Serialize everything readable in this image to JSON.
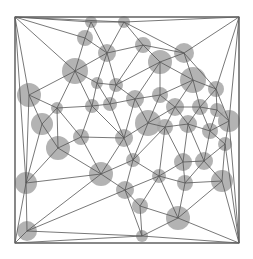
{
  "diagram": {
    "type": "triangulated-graph",
    "node_color": "#a6a6a6",
    "edge_color": "#555555",
    "border": {
      "x1": 15,
      "y1": 17,
      "x2": 239,
      "y2": 243
    },
    "nodes": [
      {
        "x": 15,
        "y": 17,
        "r": 0
      },
      {
        "x": 239,
        "y": 17,
        "r": 0
      },
      {
        "x": 15,
        "y": 243,
        "r": 0
      },
      {
        "x": 239,
        "y": 243,
        "r": 0
      },
      {
        "x": 91,
        "y": 22,
        "r": 6
      },
      {
        "x": 124,
        "y": 22,
        "r": 6
      },
      {
        "x": 85,
        "y": 38,
        "r": 8
      },
      {
        "x": 107,
        "y": 53,
        "r": 9
      },
      {
        "x": 143,
        "y": 45,
        "r": 8
      },
      {
        "x": 75,
        "y": 71,
        "r": 13
      },
      {
        "x": 160,
        "y": 62,
        "r": 12
      },
      {
        "x": 184,
        "y": 53,
        "r": 10
      },
      {
        "x": 97,
        "y": 83,
        "r": 6
      },
      {
        "x": 116,
        "y": 85,
        "r": 7
      },
      {
        "x": 29,
        "y": 95,
        "r": 12
      },
      {
        "x": 57,
        "y": 108,
        "r": 6
      },
      {
        "x": 135,
        "y": 99,
        "r": 9
      },
      {
        "x": 193,
        "y": 80,
        "r": 13
      },
      {
        "x": 216,
        "y": 89,
        "r": 8
      },
      {
        "x": 92,
        "y": 106,
        "r": 7
      },
      {
        "x": 110,
        "y": 104,
        "r": 7
      },
      {
        "x": 160,
        "y": 95,
        "r": 8
      },
      {
        "x": 42,
        "y": 124,
        "r": 11
      },
      {
        "x": 148,
        "y": 123,
        "r": 13
      },
      {
        "x": 175,
        "y": 107,
        "r": 9
      },
      {
        "x": 200,
        "y": 107,
        "r": 8
      },
      {
        "x": 217,
        "y": 110,
        "r": 7
      },
      {
        "x": 229,
        "y": 121,
        "r": 11
      },
      {
        "x": 81,
        "y": 137,
        "r": 8
      },
      {
        "x": 124,
        "y": 138,
        "r": 9
      },
      {
        "x": 165,
        "y": 127,
        "r": 8
      },
      {
        "x": 188,
        "y": 124,
        "r": 9
      },
      {
        "x": 210,
        "y": 131,
        "r": 8
      },
      {
        "x": 58,
        "y": 148,
        "r": 12
      },
      {
        "x": 225,
        "y": 144,
        "r": 7
      },
      {
        "x": 133,
        "y": 160,
        "r": 7
      },
      {
        "x": 183,
        "y": 162,
        "r": 9
      },
      {
        "x": 204,
        "y": 161,
        "r": 9
      },
      {
        "x": 101,
        "y": 174,
        "r": 12
      },
      {
        "x": 159,
        "y": 176,
        "r": 7
      },
      {
        "x": 185,
        "y": 183,
        "r": 8
      },
      {
        "x": 222,
        "y": 181,
        "r": 11
      },
      {
        "x": 26,
        "y": 183,
        "r": 11
      },
      {
        "x": 125,
        "y": 190,
        "r": 9
      },
      {
        "x": 140,
        "y": 206,
        "r": 8
      },
      {
        "x": 178,
        "y": 218,
        "r": 12
      },
      {
        "x": 27,
        "y": 231,
        "r": 10
      },
      {
        "x": 142,
        "y": 236,
        "r": 6
      }
    ]
  }
}
